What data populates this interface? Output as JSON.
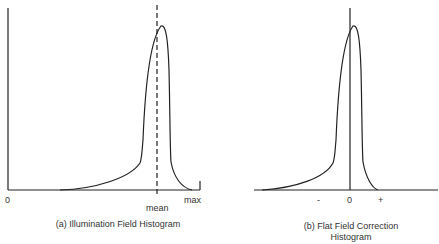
{
  "panels": [
    {
      "id": "a",
      "caption": "(a) Illumination Field Histogram",
      "x_labels": {
        "min": "0",
        "mean": "mean",
        "max": "max"
      },
      "reference_line": "dashed line at mean"
    },
    {
      "id": "b",
      "caption_line1": "(b) Flat Field Correction",
      "caption_line2": "Histogram",
      "x_labels": {
        "minus": "-",
        "zero": "0",
        "plus": "+"
      },
      "reference_line": "solid line at 0"
    }
  ],
  "colors": {
    "line": "#222222",
    "background": "#ffffff"
  }
}
